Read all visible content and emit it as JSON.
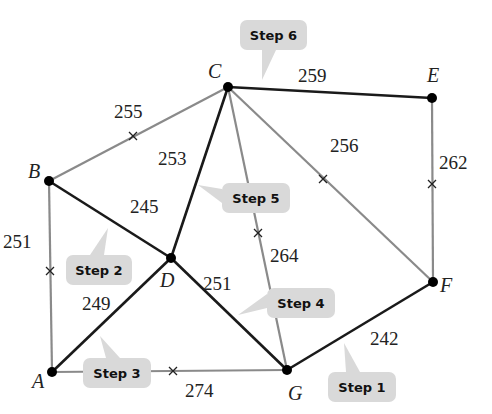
{
  "colors": {
    "selected_edge": "#1a1a1a",
    "rejected_edge": "#8a8a8a",
    "vertex": "#000000",
    "callout_fill": "#d9d9d9",
    "callout_text": "#111111"
  },
  "vertices": [
    {
      "id": "A",
      "label": "A"
    },
    {
      "id": "B",
      "label": "B"
    },
    {
      "id": "C",
      "label": "C"
    },
    {
      "id": "D",
      "label": "D"
    },
    {
      "id": "E",
      "label": "E"
    },
    {
      "id": "F",
      "label": "F"
    },
    {
      "id": "G",
      "label": "G"
    }
  ],
  "edges": [
    {
      "from": "F",
      "to": "G",
      "weight": "242",
      "selected": true,
      "crossed": false
    },
    {
      "from": "B",
      "to": "D",
      "weight": "245",
      "selected": true,
      "crossed": false
    },
    {
      "from": "A",
      "to": "D",
      "weight": "249",
      "selected": true,
      "crossed": false
    },
    {
      "from": "D",
      "to": "G",
      "weight": "251",
      "selected": true,
      "crossed": false
    },
    {
      "from": "A",
      "to": "B",
      "weight": "251",
      "selected": false,
      "crossed": true
    },
    {
      "from": "C",
      "to": "D",
      "weight": "253",
      "selected": true,
      "crossed": false
    },
    {
      "from": "B",
      "to": "C",
      "weight": "255",
      "selected": false,
      "crossed": true
    },
    {
      "from": "C",
      "to": "F",
      "weight": "256",
      "selected": false,
      "crossed": true
    },
    {
      "from": "C",
      "to": "E",
      "weight": "259",
      "selected": true,
      "crossed": false
    },
    {
      "from": "E",
      "to": "F",
      "weight": "262",
      "selected": false,
      "crossed": true
    },
    {
      "from": "C",
      "to": "G",
      "weight": "264",
      "selected": false,
      "crossed": true
    },
    {
      "from": "A",
      "to": "G",
      "weight": "274",
      "selected": false,
      "crossed": true
    }
  ],
  "callouts": [
    {
      "label": "Step 1",
      "edge": "F-G"
    },
    {
      "label": "Step 2",
      "edge": "B-D"
    },
    {
      "label": "Step 3",
      "edge": "A-D"
    },
    {
      "label": "Step 4",
      "edge": "D-G"
    },
    {
      "label": "Step 5",
      "edge": "C-D"
    },
    {
      "label": "Step 6",
      "edge": "C-E"
    }
  ]
}
